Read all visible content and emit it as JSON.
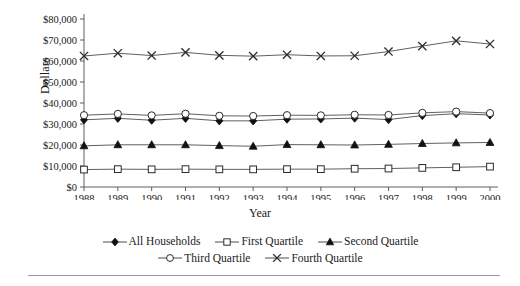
{
  "chart_data": {
    "type": "line",
    "title": "",
    "xlabel": "Year",
    "ylabel": "Dollars",
    "categories": [
      1988,
      1989,
      1990,
      1991,
      1992,
      1993,
      1994,
      1995,
      1996,
      1997,
      1998,
      1999,
      2000
    ],
    "xtick_labels": [
      "1988",
      "1989",
      "1990",
      "1991",
      "1992",
      "1993",
      "1994",
      "1995",
      "1996",
      "1997",
      "1998",
      "1999",
      "2000"
    ],
    "ytick_labels": [
      "$0",
      "$10,000",
      "$20,000",
      "$30,000",
      "$40,000",
      "$50,000",
      "$60,000",
      "$70,000",
      "$80,000"
    ],
    "ytick_values": [
      0,
      10000,
      20000,
      30000,
      40000,
      50000,
      60000,
      70000,
      80000
    ],
    "ylim": [
      0,
      80000
    ],
    "grid": false,
    "legend_position": "bottom",
    "series": [
      {
        "name": "All Households",
        "marker": "filled-diamond",
        "values": [
          32000,
          32700,
          31800,
          32700,
          31500,
          31500,
          32300,
          32400,
          32800,
          32100,
          34000,
          34900,
          34300
        ]
      },
      {
        "name": "First Quartile",
        "marker": "open-square",
        "values": [
          8300,
          8500,
          8400,
          8500,
          8400,
          8400,
          8500,
          8500,
          8700,
          8800,
          9100,
          9400,
          9700
        ]
      },
      {
        "name": "Second Quartile",
        "marker": "filled-triangle",
        "values": [
          19600,
          20100,
          20100,
          20100,
          19700,
          19400,
          20200,
          20100,
          20000,
          20300,
          20700,
          21000,
          21200
        ]
      },
      {
        "name": "Third Quartile",
        "marker": "open-circle",
        "values": [
          34200,
          34800,
          34100,
          34900,
          33900,
          33800,
          34200,
          34100,
          34400,
          34300,
          35300,
          35900,
          35200
        ]
      },
      {
        "name": "Fourth Quartile",
        "marker": "x-cross",
        "values": [
          62400,
          63700,
          62600,
          64100,
          62700,
          62300,
          63000,
          62400,
          62500,
          64500,
          67100,
          69600,
          68100
        ]
      }
    ]
  },
  "axes": {
    "ylabel": "Dollars",
    "xlabel": "Year"
  },
  "legend": {
    "row1": [
      {
        "label": "All Households",
        "marker": "filled-diamond"
      },
      {
        "label": "First Quartile",
        "marker": "open-square"
      },
      {
        "label": "Second Quartile",
        "marker": "filled-triangle"
      }
    ],
    "row2": [
      {
        "label": "Third Quartile",
        "marker": "open-circle"
      },
      {
        "label": "Fourth Quartile",
        "marker": "x-cross"
      }
    ]
  },
  "colors": {
    "line": "#4d4d4d",
    "marker_fill": "#111111",
    "marker_open": "#ffffff",
    "axis": "#4d4d4d",
    "text": "#1a1a1a",
    "rule": "#9a9a9a"
  }
}
